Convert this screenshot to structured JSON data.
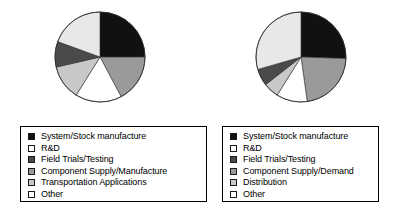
{
  "chart_data": [
    {
      "type": "pie",
      "name": "left-pie-chart",
      "title": "",
      "legend_position": "bottom",
      "start_angle_deg": 0,
      "direction": "clockwise",
      "categories": [
        "System/Stock manufacture",
        "Component Supply/Manufacture",
        "Other",
        "Transportation Applications",
        "Field Trials/Testing",
        "R&D"
      ],
      "values": [
        25.0,
        17.2,
        16.7,
        12.5,
        9.2,
        19.4
      ],
      "angles_deg": [
        90,
        62,
        60,
        45,
        33,
        70
      ],
      "colors": [
        "#111111",
        "#9a9a9a",
        "#ffffff",
        "#c8c8c8",
        "#4a4a4a",
        "#e8e8e8"
      ]
    },
    {
      "type": "pie",
      "name": "right-pie-chart",
      "title": "",
      "legend_position": "bottom",
      "start_angle_deg": 0,
      "direction": "clockwise",
      "categories": [
        "System/Stock manufacture",
        "Component Supply/Demand",
        "Other",
        "Distribution",
        "Field Trials/Testing",
        "R&D"
      ],
      "values": [
        25.6,
        22.2,
        11.1,
        5.6,
        6.1,
        29.4
      ],
      "angles_deg": [
        92,
        80,
        40,
        20,
        22,
        106
      ],
      "colors": [
        "#111111",
        "#9a9a9a",
        "#ffffff",
        "#c8c8c8",
        "#4a4a4a",
        "#e8e8e8"
      ]
    }
  ],
  "left_panel": {
    "legend": {
      "items": [
        {
          "label": "System/Stock manufacture",
          "color": "#111111"
        },
        {
          "label": "R&D",
          "color": "#ffffff"
        },
        {
          "label": "Field Trials/Testing",
          "color": "#4a4a4a"
        },
        {
          "label": "Component Supply/Manufacture",
          "color": "#9a9a9a"
        },
        {
          "label": "Transportation Applications",
          "color": "#c8c8c8"
        },
        {
          "label": "Other",
          "color": "#ffffff"
        }
      ]
    }
  },
  "right_panel": {
    "legend": {
      "items": [
        {
          "label": "System/Stock manufacture",
          "color": "#111111"
        },
        {
          "label": "R&D",
          "color": "#ffffff"
        },
        {
          "label": "Field Trials/Testing",
          "color": "#4a4a4a"
        },
        {
          "label": "Component Supply/Demand",
          "color": "#9a9a9a"
        },
        {
          "label": "Distribution",
          "color": "#c8c8c8"
        },
        {
          "label": "Other",
          "color": "#ffffff"
        }
      ]
    }
  }
}
